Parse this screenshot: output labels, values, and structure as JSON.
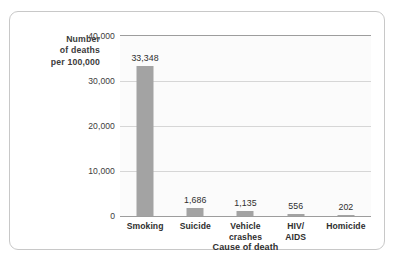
{
  "chart_data": {
    "type": "bar",
    "title": "",
    "xlabel": "Cause of death",
    "ylabel": "Number of deaths per 100,000",
    "ylabel_lines": [
      "Number",
      "of deaths",
      "per 100,000"
    ],
    "categories": [
      "Smoking",
      "Suicide",
      "Vehicle crashes",
      "HIV/ AIDS",
      "Homicide"
    ],
    "category_lines": [
      [
        "Smoking"
      ],
      [
        "Suicide"
      ],
      [
        "Vehicle",
        "crashes"
      ],
      [
        "HIV/",
        "AIDS"
      ],
      [
        "Homicide"
      ]
    ],
    "values": [
      33348,
      1686,
      1135,
      556,
      202
    ],
    "value_labels": [
      "33,348",
      "1,686",
      "1,135",
      "556",
      "202"
    ],
    "ylim": [
      0,
      40000
    ],
    "yticks": [
      0,
      10000,
      20000,
      30000,
      40000
    ],
    "ytick_labels": [
      "0",
      "10,000",
      "20,000",
      "30,000",
      "40,000"
    ],
    "grid": true,
    "legend": "none",
    "bar_color": "#a3a3a3",
    "plot_background": "#fbfbfb",
    "axis_color": "#9d9d9d",
    "gridline_color": "#d6d6d6",
    "text_color": "#2f2f2f",
    "border_color": "#c8c8c8"
  }
}
